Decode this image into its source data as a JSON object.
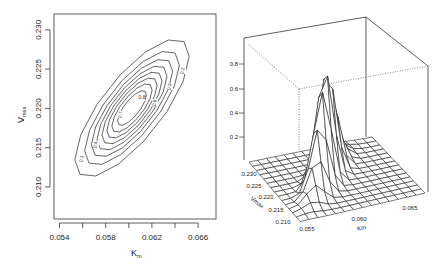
{
  "chart_data": [
    {
      "type": "contour",
      "title": "",
      "xlabel": "K_m",
      "ylabel": "V_max",
      "xlabel_main": "K",
      "xlabel_sub": "m",
      "ylabel_main": "V",
      "ylabel_sub": "max",
      "xlim": [
        0.0535,
        0.0675
      ],
      "ylim": [
        0.2059,
        0.2315
      ],
      "x_ticks": [
        0.054,
        0.056,
        0.058,
        0.06,
        0.062,
        0.064,
        0.066
      ],
      "x_tick_labels": [
        "0.054",
        "",
        "0.058",
        "",
        "0.062",
        "",
        "0.066"
      ],
      "y_ticks": [
        0.21,
        0.215,
        0.22,
        0.225,
        0.23
      ],
      "y_tick_labels": [
        "0.210",
        "0.215",
        "0.220",
        "0.225",
        "0.230"
      ],
      "contour_levels": [
        0.1,
        0.2,
        0.3,
        0.4,
        0.5,
        0.6,
        0.7,
        0.8
      ],
      "visible_contour_labels": [
        "0.1",
        "0.2",
        "0.3",
        "0.4",
        "0.6",
        "0.7",
        "0.8"
      ],
      "peak": {
        "x": 0.0606,
        "y": 0.2195,
        "z": 0.9
      },
      "correlation": 0.85,
      "grid": false
    },
    {
      "type": "surface3d",
      "title": "",
      "xlabel": "Km",
      "ylabel": "Vmax",
      "zlabel": "",
      "x_tick_labels": [
        "0.055",
        "0.060",
        "0.065"
      ],
      "y_tick_labels": [
        "0.210",
        "0.215",
        "0.220",
        "0.225",
        "0.230"
      ],
      "z_tick_labels": [
        "0.2",
        "0.4",
        "0.6",
        "0.8"
      ],
      "z_ticks": [
        0.2,
        0.4,
        0.6,
        0.8
      ],
      "grid_size": [
        15,
        15
      ],
      "peak_value": 0.9,
      "grid": false
    }
  ]
}
